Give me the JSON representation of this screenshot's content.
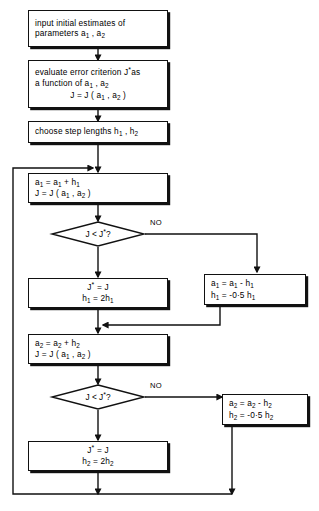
{
  "diagram": {
    "stroke_color": "#111111",
    "background_color": "#ffffff",
    "nodes": {
      "input": {
        "shape": "process",
        "line1": "input initial estimates of",
        "line2_pre": "parameters a",
        "line2_sub1": "1",
        "line2_mid": " , a",
        "line2_sub2": "2"
      },
      "evaluate": {
        "shape": "process",
        "line1_pre": "evaluate error criterion J",
        "line1_star": "*",
        "line1_post": "as",
        "line2_pre": "a function of  a",
        "line2_sub1": "1",
        "line2_mid": " , a",
        "line2_sub2": "2",
        "line3_pre": "J = J ( a",
        "line3_sub1": "1",
        "line3_mid": " , a",
        "line3_sub2": "2",
        "line3_post": " )"
      },
      "steps": {
        "shape": "process",
        "line1_pre": "choose step lengths  h",
        "line1_sub1": "1",
        "line1_mid": " , h",
        "line1_sub2": "2"
      },
      "a1_plus": {
        "shape": "process",
        "line1_pre": "a",
        "line1_sub1": "1",
        "line1_mid": " = a",
        "line1_sub2": "1",
        "line1_post": " + h",
        "line1_sub3": "1",
        "line2_pre": "J = J ( a",
        "line2_sub1": "1",
        "line2_mid": " , a",
        "line2_sub2": "2",
        "line2_post": " )"
      },
      "decision1": {
        "shape": "decision",
        "text_pre": "J < J",
        "text_star": "*",
        "text_post": " ?",
        "no_label": "NO"
      },
      "accept1": {
        "shape": "process",
        "line1_pre": "J",
        "line1_star": "*",
        "line1_post": " = J",
        "line2_pre": "h",
        "line2_sub1": "1",
        "line2_mid": " = 2h",
        "line2_sub2": "1"
      },
      "reject1": {
        "shape": "process",
        "line1_pre": "a",
        "line1_sub1": "1",
        "line1_mid": " = a",
        "line1_sub2": "1",
        "line1_post": " - h",
        "line1_sub3": "1",
        "line2_pre": "h",
        "line2_sub1": "1",
        "line2_mid": " = -0·5 h",
        "line2_sub2": "1"
      },
      "a2_plus": {
        "shape": "process",
        "line1_pre": "a",
        "line1_sub1": "2",
        "line1_mid": " = a",
        "line1_sub2": "2",
        "line1_post": " + h",
        "line1_sub3": "2",
        "line2_pre": "J = J ( a",
        "line2_sub1": "1",
        "line2_mid": " , a",
        "line2_sub2": "2",
        "line2_post": " )"
      },
      "decision2": {
        "shape": "decision",
        "text_pre": "J < J",
        "text_star": "*",
        "text_post": " ?",
        "no_label": "NO"
      },
      "accept2": {
        "shape": "process",
        "line1_pre": "J",
        "line1_star": "*",
        "line1_post": " = J",
        "line2_pre": "h",
        "line2_sub1": "2",
        "line2_mid": " = 2h",
        "line2_sub2": "2"
      },
      "reject2": {
        "shape": "process",
        "line1_pre": "a",
        "line1_sub1": "2",
        "line1_mid": " = a",
        "line1_sub2": "2",
        "line1_post": " - h",
        "line1_sub3": "2",
        "line2_pre": "h",
        "line2_sub1": "2",
        "line2_mid": " = -0·5 h",
        "line2_sub2": "2"
      }
    }
  }
}
